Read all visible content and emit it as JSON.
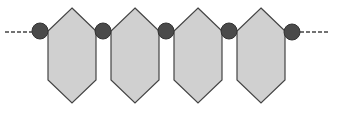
{
  "diagram": {
    "title": "",
    "colors": {
      "hexagon_fill": "#d0d0d0",
      "hexagon_stroke": "#444444",
      "node_fill": "#4a4a4a",
      "node_stroke": "#333333",
      "connector": "#444444"
    },
    "hexagon_count": 4,
    "node_count": 5,
    "ends": {
      "left": "dashed-continuation",
      "right": "dashed-continuation"
    }
  }
}
